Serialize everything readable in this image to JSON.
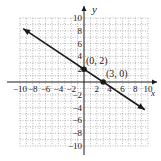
{
  "chart_data": {
    "type": "line",
    "title": "",
    "xlabel": "x",
    "ylabel": "y",
    "xlim": [
      -10,
      10
    ],
    "ylim": [
      -10,
      10
    ],
    "grid": true,
    "x_tick_labels": [
      "-10",
      "-8",
      "-6",
      "-4",
      "-2",
      "2",
      "4",
      "6",
      "8",
      "10"
    ],
    "y_tick_labels": [
      "10",
      "8",
      "6",
      "4",
      "2",
      "-2",
      "-4",
      "-6",
      "-8",
      "-10"
    ],
    "series": [
      {
        "name": "line",
        "equation": "y = -2/3 x + 2",
        "x": [
          -9.5,
          9.5
        ],
        "y": [
          8.33,
          -4.33
        ],
        "arrows": "both"
      }
    ],
    "points": [
      {
        "label": "(0, 2)",
        "x": 0,
        "y": 2
      },
      {
        "label": "(3, 0)",
        "x": 3,
        "y": 0
      }
    ]
  },
  "labels": {
    "x_axis": "x",
    "y_axis": "y",
    "point1": "(0, 2)",
    "point2": "(3, 0)"
  },
  "colors": {
    "line": "#1a1a1a",
    "grid": "#888888",
    "axis": "#1a1a1a"
  }
}
